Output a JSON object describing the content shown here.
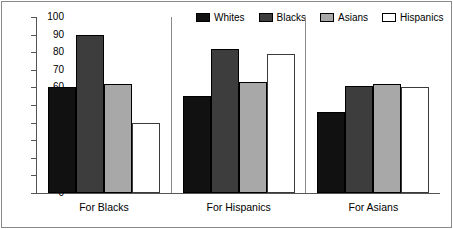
{
  "chart_data": {
    "type": "bar",
    "title": "",
    "subtitle": "",
    "xlabel": "",
    "ylabel": "",
    "ylim": [
      0,
      100
    ],
    "ytick_step": 10,
    "yticks": [
      0,
      10,
      20,
      30,
      40,
      50,
      60,
      70,
      80,
      90,
      100
    ],
    "ytick_labels": [
      "0",
      "10",
      "20",
      "30",
      "40",
      "50",
      "60",
      "70",
      "80",
      "90",
      "100"
    ],
    "grid": false,
    "legend_position": "top-right",
    "categories": [
      "For Blacks",
      "For Hispanics",
      "For Asians"
    ],
    "series": [
      {
        "name": "Whites",
        "color": "#111111",
        "values": [
          60,
          55,
          46
        ]
      },
      {
        "name": "Blacks",
        "color": "#3d3d3d",
        "values": [
          90,
          82,
          61
        ]
      },
      {
        "name": "Asians",
        "color": "#a8a8a8",
        "values": [
          62,
          63,
          62
        ]
      },
      {
        "name": "Hispanics",
        "color": "#ffffff",
        "values": [
          40,
          79,
          60
        ]
      }
    ]
  },
  "legend": {
    "entries": [
      {
        "label": "Whites"
      },
      {
        "label": "Blacks"
      },
      {
        "label": "Asians"
      },
      {
        "label": "Hispanics"
      }
    ]
  },
  "axis": {
    "y_labels": [
      "100",
      "90",
      "80",
      "70",
      "60",
      "50",
      "40",
      "30",
      "20",
      "10",
      "0"
    ]
  }
}
